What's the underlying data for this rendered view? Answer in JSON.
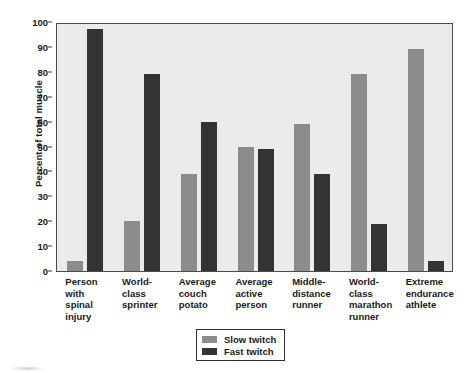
{
  "chart_data": {
    "type": "bar",
    "title": "",
    "xlabel": "",
    "ylabel": "Percent of total muscle",
    "ylim": [
      0,
      100
    ],
    "ytick_step": 10,
    "yticks": [
      0,
      10,
      20,
      30,
      40,
      50,
      60,
      70,
      80,
      90,
      100
    ],
    "grid": false,
    "legend_position": "bottom-center",
    "categories": [
      "Person\nwith\nspinal\ninjury",
      "World-\nclass\nsprinter",
      "Average\ncouch\npotato",
      "Average\nactive\nperson",
      "Middle-\ndistance\nrunner",
      "World-\nclass\nmarathon\nrunner",
      "Extreme\nendurance\nathlete"
    ],
    "series": [
      {
        "name": "Slow twitch",
        "color": "#8c8c8c",
        "values": [
          4,
          20,
          39,
          50,
          59,
          79,
          89
        ]
      },
      {
        "name": "Fast twitch",
        "color": "#333333",
        "values": [
          97,
          79,
          60,
          49,
          39,
          19,
          4
        ]
      }
    ]
  },
  "figure": {
    "plot_background": "#ebebeb",
    "page_background": "#ffffff",
    "axis_color": "#4a4a4a",
    "text_color": "#1a1a1a"
  }
}
